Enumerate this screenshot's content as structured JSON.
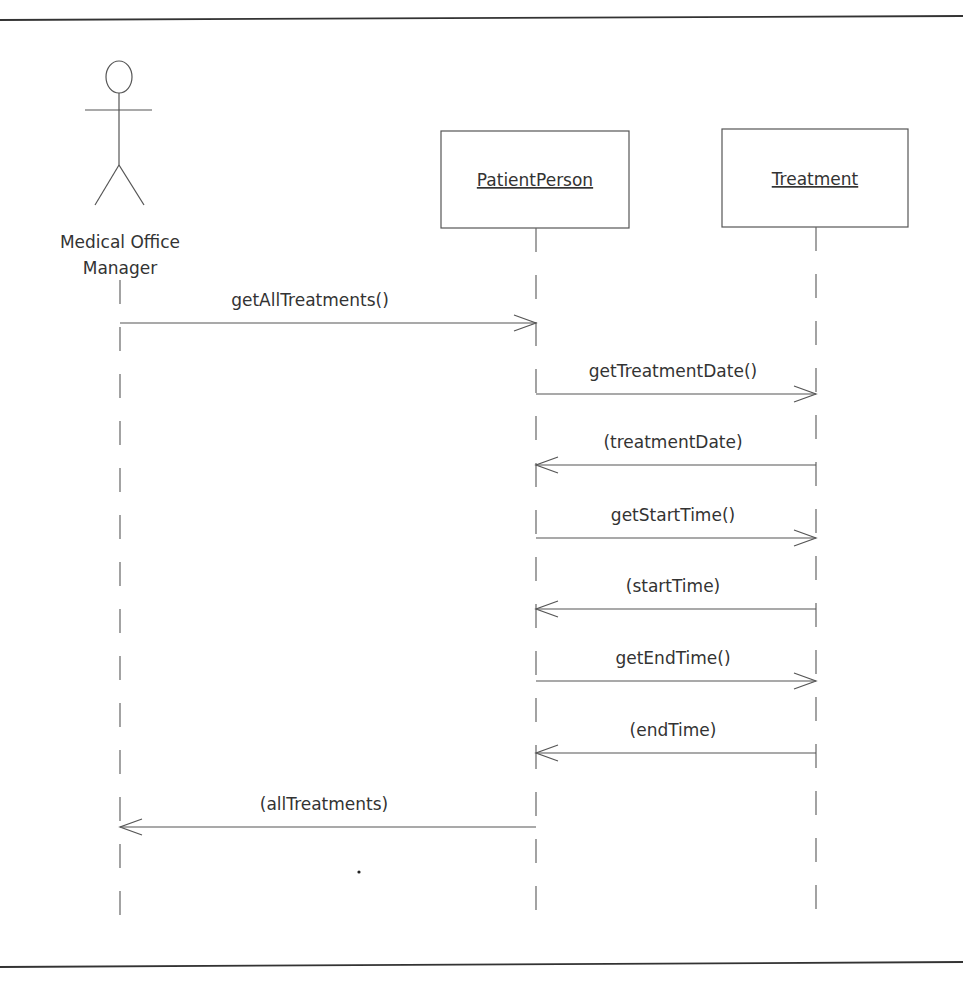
{
  "diagram": {
    "type": "UML sequence diagram",
    "actor": {
      "label_line1": "Medical Office",
      "label_line2": "Manager"
    },
    "objects": [
      {
        "label": "PatientPerson"
      },
      {
        "label": "Treatment"
      }
    ],
    "messages": [
      {
        "label": "getAllTreatments()",
        "from": "Medical Office Manager",
        "to": "PatientPerson",
        "kind": "call"
      },
      {
        "label": "getTreatmentDate()",
        "from": "PatientPerson",
        "to": "Treatment",
        "kind": "call"
      },
      {
        "label": "(treatmentDate)",
        "from": "Treatment",
        "to": "PatientPerson",
        "kind": "return"
      },
      {
        "label": "getStartTime()",
        "from": "PatientPerson",
        "to": "Treatment",
        "kind": "call"
      },
      {
        "label": "(startTime)",
        "from": "Treatment",
        "to": "PatientPerson",
        "kind": "return"
      },
      {
        "label": "getEndTime()",
        "from": "PatientPerson",
        "to": "Treatment",
        "kind": "call"
      },
      {
        "label": "(endTime)",
        "from": "Treatment",
        "to": "PatientPerson",
        "kind": "return"
      },
      {
        "label": "(allTreatments)",
        "from": "PatientPerson",
        "to": "Medical Office Manager",
        "kind": "return"
      }
    ]
  }
}
